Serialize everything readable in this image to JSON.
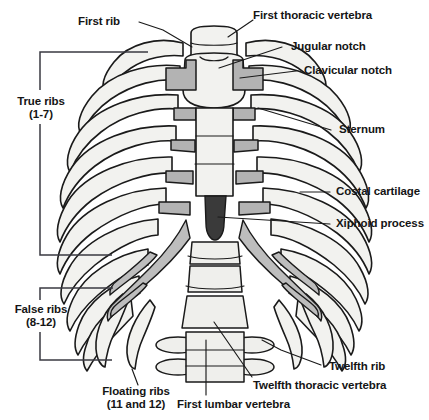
{
  "figure": {
    "background": "#ffffff",
    "colors": {
      "outline": "#1a1a1a",
      "bone_fill": "#f2f2ef",
      "cartilage_fill": "#b3b3b3",
      "xiphoid_fill": "#3a3a3a",
      "leader_line": "#1a1a1a",
      "text": "#151515"
    }
  },
  "labels": {
    "first_rib": "First rib",
    "first_thoracic_vertebra": "First thoracic vertebra",
    "jugular_notch": "Jugular notch",
    "clavicular_notch": "Clavicular notch",
    "sternum": "Sternum",
    "costal_cartilage": "Costal cartilage",
    "xiphoid_process": "Xiphoid process",
    "true_ribs": "True ribs",
    "true_ribs_range": "(1-7)",
    "false_ribs": "False ribs",
    "false_ribs_range": "(8-12)",
    "floating_ribs": "Floating ribs",
    "floating_ribs_range": "(11 and 12)",
    "twelfth_rib": "Twelfth rib",
    "twelfth_thoracic_vertebra": "Twelfth thoracic vertebra",
    "first_lumbar_vertebra": "First lumbar vertebra"
  }
}
